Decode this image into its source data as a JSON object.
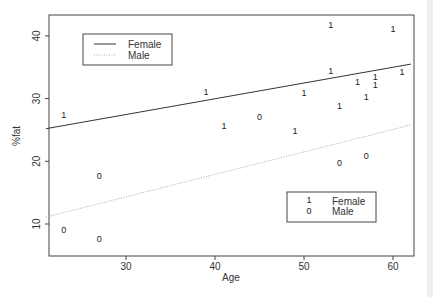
{
  "chart_data": {
    "type": "scatter",
    "title": "",
    "xlabel": "Age",
    "ylabel": "%fat",
    "xlim": [
      21,
      62
    ],
    "ylim": [
      6.5,
      43.5
    ],
    "xticks": [
      30,
      40,
      50,
      60
    ],
    "yticks": [
      10,
      20,
      30,
      40
    ],
    "grid": false,
    "series": [
      {
        "name": "Female",
        "symbol": "1",
        "points": [
          {
            "x": 23,
            "y": 27.4
          },
          {
            "x": 39,
            "y": 31.0
          },
          {
            "x": 41,
            "y": 25.6
          },
          {
            "x": 49,
            "y": 24.8
          },
          {
            "x": 50,
            "y": 30.9
          },
          {
            "x": 53,
            "y": 41.7
          },
          {
            "x": 53,
            "y": 34.4
          },
          {
            "x": 54,
            "y": 28.8
          },
          {
            "x": 56,
            "y": 32.6
          },
          {
            "x": 57,
            "y": 30.2
          },
          {
            "x": 58,
            "y": 33.5
          },
          {
            "x": 58,
            "y": 32.1
          },
          {
            "x": 60,
            "y": 41.1
          },
          {
            "x": 61,
            "y": 34.2
          }
        ]
      },
      {
        "name": "Male",
        "symbol": "0",
        "points": [
          {
            "x": 23,
            "y": 9.1
          },
          {
            "x": 27,
            "y": 17.6
          },
          {
            "x": 27,
            "y": 7.6
          },
          {
            "x": 45,
            "y": 27.1
          },
          {
            "x": 54,
            "y": 19.7
          },
          {
            "x": 57,
            "y": 20.8
          }
        ]
      }
    ],
    "fit_lines": [
      {
        "name": "Female",
        "style": "solid",
        "x": [
          21,
          62
        ],
        "y": [
          25.2,
          35.5
        ]
      },
      {
        "name": "Male",
        "style": "dotted",
        "x": [
          21,
          62
        ],
        "y": [
          11.1,
          25.8
        ]
      }
    ],
    "legends": [
      {
        "position": "top-left",
        "entries": [
          {
            "label": "Female",
            "marker": "solid-line"
          },
          {
            "label": "Male",
            "marker": "dotted-line"
          }
        ]
      },
      {
        "position": "bottom-right",
        "entries": [
          {
            "label": "Female",
            "marker": "1"
          },
          {
            "label": "Male",
            "marker": "0"
          }
        ]
      }
    ]
  },
  "labels": {
    "xlabel": "Age",
    "ylabel": "%fat",
    "legend_lines_female": "Female",
    "legend_lines_male": "Male",
    "legend_symbols_female_symbol": "1",
    "legend_symbols_female": "Female",
    "legend_symbols_male_symbol": "0",
    "legend_symbols_male": "Male"
  }
}
